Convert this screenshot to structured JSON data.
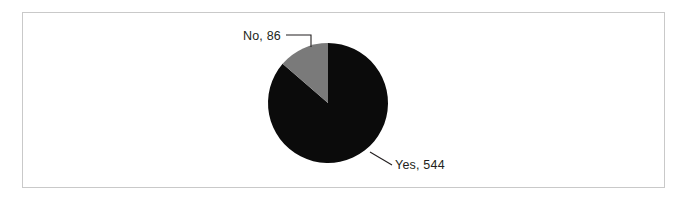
{
  "chart_data": {
    "type": "pie",
    "title": "",
    "subtitle": "",
    "xlabel": "",
    "ylabel": "",
    "grid": false,
    "legend_position": "none",
    "label_style": "callout-leader-lines",
    "total": 630,
    "categories": [
      "Yes",
      "No"
    ],
    "values": [
      544,
      86
    ],
    "percentages": [
      86.3,
      13.7
    ],
    "slices": [
      {
        "name": "Yes",
        "value": 544,
        "label": "Yes, 544",
        "color": "#0b0b0b",
        "percent": 86.3,
        "start_angle_deg": 0,
        "sweep_deg": 310.86,
        "direction": "clockwise-from-top"
      },
      {
        "name": "No",
        "value": 86,
        "label": "No, 86",
        "color": "#7a7a7a",
        "percent": 13.7,
        "start_angle_deg": 310.86,
        "sweep_deg": 49.14,
        "direction": "clockwise-from-top"
      }
    ],
    "annotations": [
      {
        "text": "No, 86",
        "anchor": "end",
        "x": 281,
        "y": 40
      },
      {
        "text": "Yes, 544",
        "anchor": "start",
        "x": 395,
        "y": 169
      }
    ]
  },
  "figure": {
    "frame_color": "#c9c9c9",
    "background": "#ffffff",
    "pie": {
      "center_x": 328,
      "center_y": 103,
      "radius": 60
    }
  }
}
